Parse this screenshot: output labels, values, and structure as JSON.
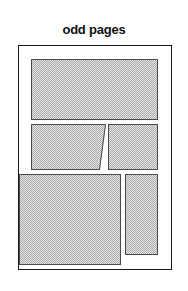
{
  "diagram": {
    "title": "odd pages",
    "type": "page-layout-schematic",
    "page_frame": {
      "name": "page-outline",
      "x": 18,
      "y": 45,
      "width": 154,
      "height": 225,
      "border_color": "#1a1a1a",
      "fill_color": "#ffffff"
    },
    "block_fill_color": "#e6e6e6",
    "block_border_color": "#4a4a4a",
    "blocks": [
      {
        "id": "block-top-wide",
        "label": "top wide block",
        "shape": "rectangle",
        "x": 31,
        "y": 59,
        "width": 127,
        "height": 61
      },
      {
        "id": "block-mid-left",
        "label": "middle left block with slanted right edge",
        "shape": "slanted-right",
        "x": 31,
        "y": 124,
        "width": 75,
        "height": 46
      },
      {
        "id": "block-mid-right",
        "label": "middle right block",
        "shape": "rectangle",
        "x": 108,
        "y": 124,
        "width": 50,
        "height": 46
      },
      {
        "id": "block-bottom-left",
        "label": "bottom large left block",
        "shape": "rectangle",
        "x": 19,
        "y": 174,
        "width": 102,
        "height": 91
      },
      {
        "id": "block-bottom-right",
        "label": "bottom narrow right block",
        "shape": "rectangle",
        "x": 125,
        "y": 174,
        "width": 33,
        "height": 81
      }
    ]
  }
}
